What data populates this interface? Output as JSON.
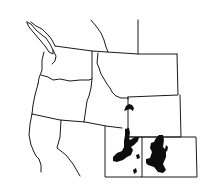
{
  "map": {
    "type": "range-map",
    "region": "Western United States",
    "states_shown": [
      "Washington",
      "Oregon",
      "California",
      "Idaho",
      "Nevada",
      "Montana",
      "Wyoming",
      "Utah",
      "Colorado"
    ],
    "range_color": "#0d0d0d",
    "border_color": "#1a1a1a",
    "background_color": "#ffffff",
    "range_areas": [
      {
        "name": "southwest-wyoming-patch"
      },
      {
        "name": "eastern-utah-main"
      },
      {
        "name": "western-colorado-main"
      },
      {
        "name": "southeast-utah-dot-1"
      },
      {
        "name": "southeast-utah-dot-2"
      }
    ]
  }
}
